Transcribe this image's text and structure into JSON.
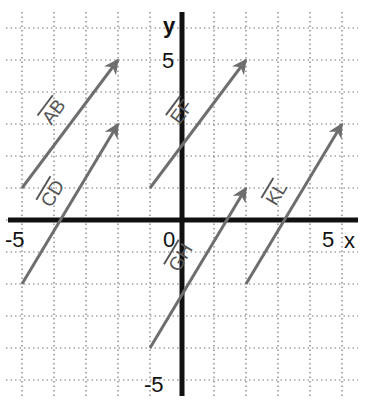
{
  "diagram": {
    "type": "coordinate-plane-vectors",
    "axes": {
      "x_label": "x",
      "y_label": "y",
      "origin_label": "0",
      "x_min_label": "-5",
      "x_max_label": "5",
      "y_max_label": "5",
      "y_min_label": "-5",
      "x_range": [
        -5,
        5
      ],
      "y_range": [
        -5,
        6
      ],
      "grid": "dotted"
    },
    "vectors": [
      {
        "name": "AB",
        "label": "AB",
        "from": [
          -5,
          1
        ],
        "to": [
          -2,
          5
        ]
      },
      {
        "name": "CD",
        "label": "CD",
        "from": [
          -5,
          -2
        ],
        "to": [
          -2,
          3
        ]
      },
      {
        "name": "EF",
        "label": "EF",
        "from": [
          -1,
          1
        ],
        "to": [
          2,
          5
        ]
      },
      {
        "name": "GH",
        "label": "GH",
        "from": [
          -1,
          -4
        ],
        "to": [
          2,
          1
        ]
      },
      {
        "name": "KL",
        "label": "KL",
        "from": [
          2,
          -2
        ],
        "to": [
          5,
          3
        ]
      }
    ],
    "colors": {
      "axis": "#111111",
      "grid": "#777777",
      "vector": "#6e6e6e"
    }
  }
}
